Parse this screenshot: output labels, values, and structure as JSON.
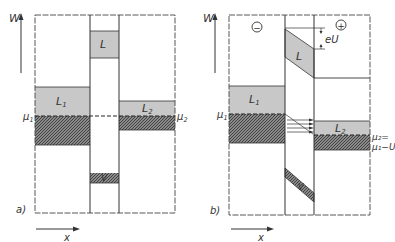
{
  "figure": {
    "panel_a": {
      "caption": "a)",
      "y_axis_label": "W",
      "x_axis_label": "x",
      "bands": {
        "left_conduction": "L",
        "left_sub": "1",
        "barrier_conduction": "L",
        "right_conduction": "L",
        "right_sub": "2",
        "barrier_valence": "V"
      },
      "fermi_left": "μ",
      "fermi_left_sub": "1",
      "fermi_right": "μ",
      "fermi_right_sub": "2"
    },
    "panel_b": {
      "caption": "b)",
      "y_axis_label": "W",
      "x_axis_label": "x",
      "minus_sign": "−",
      "plus_sign": "+",
      "voltage_drop": "eU",
      "bands": {
        "left_conduction": "L",
        "left_sub": "1",
        "barrier_conduction": "L",
        "right_conduction": "L",
        "right_sub": "2",
        "barrier_valence": "V"
      },
      "fermi_left": "μ",
      "fermi_left_sub": "1",
      "fermi_right_line1": "μ₂=",
      "fermi_right_line2": "μ₁−U"
    },
    "colors": {
      "line": "#333333",
      "band_fill": "#c8c8c8",
      "hatch_fill": "#6e6e6e",
      "background": "#ffffff"
    }
  }
}
